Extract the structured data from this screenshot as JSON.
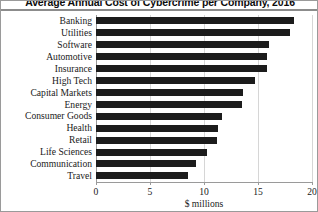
{
  "chart_data": {
    "type": "bar",
    "orientation": "horizontal",
    "title": "Average Annual Cost of Cybercrime per Company, 2016",
    "xlabel": "$ millions",
    "ylabel": "",
    "xlim": [
      0,
      20
    ],
    "xticks": [
      0,
      5,
      10,
      15,
      20
    ],
    "xtick_labels": [
      "0",
      "5",
      "10",
      "15",
      "20"
    ],
    "grid": true,
    "grid_axis": "x",
    "legend": false,
    "bar_color": "#1c1c1c",
    "categories": [
      "Banking",
      "Utilities",
      "Software",
      "Automotive",
      "Insurance",
      "High Tech",
      "Capital Markets",
      "Energy",
      "Consumer Goods",
      "Health",
      "Retail",
      "Life Sciences",
      "Communication",
      "Travel"
    ],
    "values": [
      18.3,
      18.0,
      16.0,
      15.8,
      15.8,
      14.7,
      13.6,
      13.5,
      11.7,
      11.3,
      11.2,
      10.3,
      9.3,
      8.5
    ]
  }
}
